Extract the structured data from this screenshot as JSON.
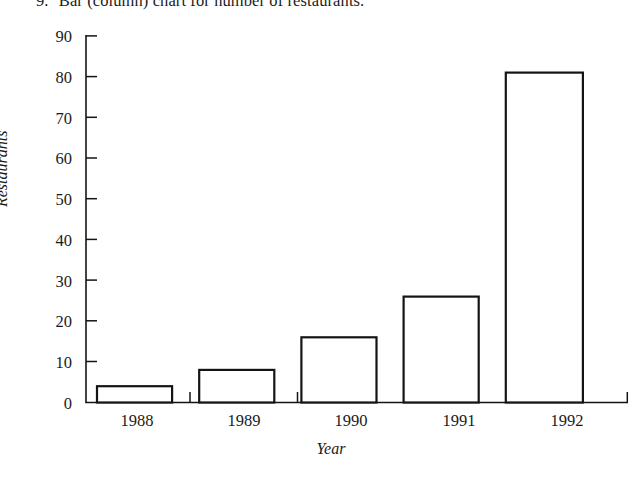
{
  "caption": {
    "marker": "9.",
    "text": "Bar (column) chart for number of restaurants."
  },
  "chart_data": {
    "type": "bar",
    "title": "",
    "subtitle": "",
    "xlabel": "Year",
    "ylabel": "Restaurants",
    "categories": [
      "1988",
      "1989",
      "1990",
      "1991",
      "1992"
    ],
    "values": [
      4,
      8,
      16,
      26,
      81
    ],
    "series": [
      {
        "name": "Restaurants",
        "values": [
          4,
          8,
          16,
          26,
          81
        ]
      }
    ],
    "ylim": [
      0,
      90
    ],
    "ytick_step": 10,
    "ytick_labels": [
      "0",
      "10",
      "20",
      "30",
      "40",
      "50",
      "60",
      "70",
      "80",
      "90"
    ],
    "xtick_labels": [
      "1988",
      "1989",
      "1990",
      "1991",
      "1992"
    ],
    "grid": false,
    "legend": false,
    "legend_position": "none",
    "bar_fill": "#ffffff",
    "bar_outline": "#141414",
    "axis_color": "#141414",
    "background": "#ffffff",
    "annotations": []
  }
}
